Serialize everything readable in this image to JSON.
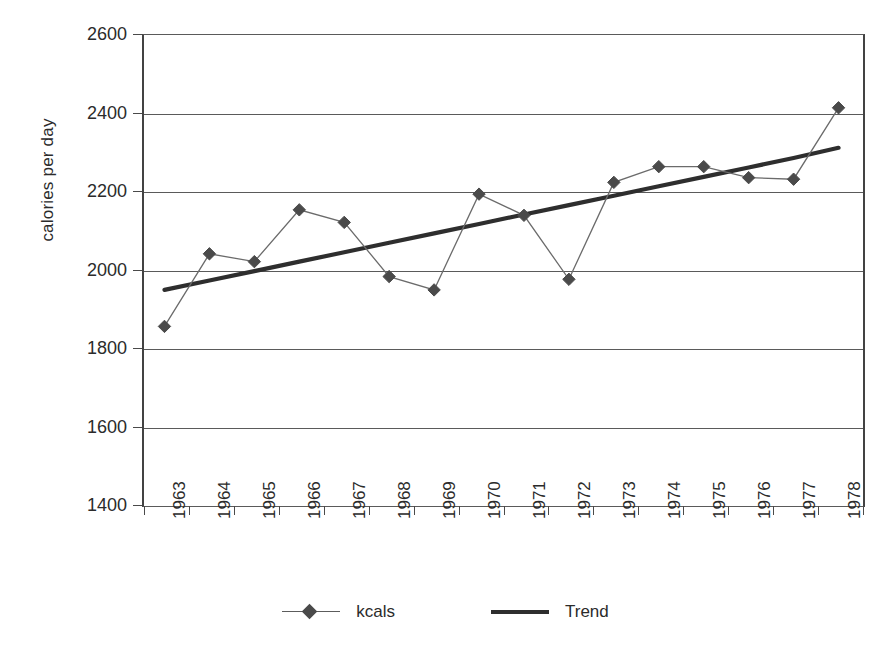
{
  "chart_data": {
    "type": "line",
    "title": "",
    "xlabel": "",
    "ylabel": "calories per day",
    "categories": [
      "1963",
      "1964",
      "1965",
      "1966",
      "1967",
      "1968",
      "1969",
      "1970",
      "1971",
      "1972",
      "1973",
      "1974",
      "1975",
      "1976",
      "1977",
      "1978"
    ],
    "ylim": [
      1400,
      2600
    ],
    "yticks": [
      1400,
      1600,
      1800,
      2000,
      2200,
      2400,
      2600
    ],
    "ytick_labels": [
      "1400",
      "1600",
      "1800",
      "2000",
      "2200",
      "2400",
      "2600"
    ],
    "grid": true,
    "legend_position": "bottom",
    "series": [
      {
        "name": "kcals",
        "marker": "diamond",
        "color": "#4a4a4a",
        "values": [
          1855,
          2040,
          2020,
          2152,
          2120,
          1982,
          1948,
          2192,
          2138,
          1975,
          2222,
          2262,
          2262,
          2234,
          2230,
          2412
        ]
      },
      {
        "name": "Trend",
        "marker": "none",
        "color": "#2e2e2e",
        "values": [
          1948,
          1972,
          1996,
          2020,
          2044,
          2068,
          2092,
          2116,
          2140,
          2164,
          2188,
          2212,
          2236,
          2260,
          2284,
          2310
        ]
      }
    ]
  },
  "legend": {
    "entries": [
      {
        "label": "kcals",
        "style": "line-with-diamond-marker"
      },
      {
        "label": "Trend",
        "style": "thick-line"
      }
    ]
  },
  "axes": {
    "y_title": "calories per day"
  }
}
